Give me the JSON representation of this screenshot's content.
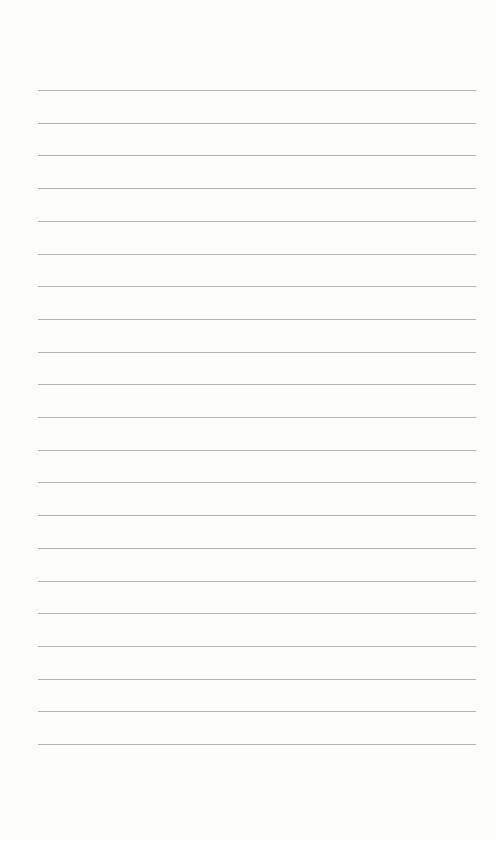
{
  "page": {
    "type": "lined-paper",
    "background_color": "#fdfdfc",
    "line_color": "#b4b4b4",
    "line_count": 21,
    "line_left": 38,
    "line_right": 476,
    "first_line_y": 90,
    "line_spacing": 32.7
  }
}
